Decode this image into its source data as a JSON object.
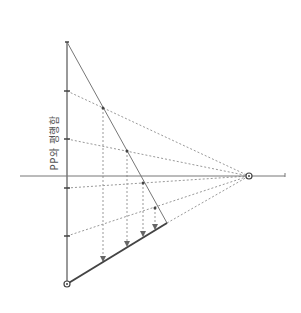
{
  "diagram": {
    "label": "PP와 평행함",
    "colors": {
      "line": "#777777",
      "thick": "#444444",
      "dashed": "#999999",
      "text": "#555555"
    },
    "horizon_line": {
      "x1": 20,
      "y1": 176,
      "x2": 285,
      "y2": 176
    },
    "vanishing_point": {
      "x": 249,
      "y": 176
    },
    "vertical_line": {
      "x": 67,
      "y_top": 42,
      "y_bottom": 284
    },
    "bottom_point": {
      "x": 67,
      "y": 284
    },
    "diagonal_line": {
      "x1": 67,
      "y1": 42,
      "x2": 167,
      "y2": 223
    },
    "thick_line": {
      "x1": 67,
      "y1": 284,
      "x2": 167,
      "y2": 223
    },
    "ticks": [
      {
        "x": 67,
        "y": 91
      },
      {
        "x": 67,
        "y": 139
      },
      {
        "x": 67,
        "y": 188
      },
      {
        "x": 67,
        "y": 236
      }
    ],
    "diagonal_points": [
      {
        "x": 103,
        "y": 108
      },
      {
        "x": 127,
        "y": 151
      },
      {
        "x": 143,
        "y": 183
      },
      {
        "x": 155,
        "y": 208
      }
    ],
    "projected_points": [
      {
        "x": 103,
        "y": 262
      },
      {
        "x": 127,
        "y": 247
      },
      {
        "x": 143,
        "y": 237
      },
      {
        "x": 155,
        "y": 230
      }
    ]
  }
}
